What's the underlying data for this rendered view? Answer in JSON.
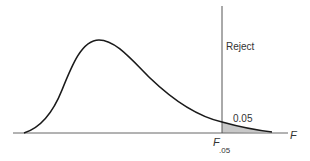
{
  "diagram": {
    "labels": {
      "reject": "Reject",
      "area": "0.05",
      "axis": "F",
      "critical_main": "F",
      "critical_sub": ".05"
    },
    "colors": {
      "curve": "#1a1a1a",
      "axis": "#555555",
      "shade": "#c8c8c8",
      "text": "#333333"
    }
  }
}
